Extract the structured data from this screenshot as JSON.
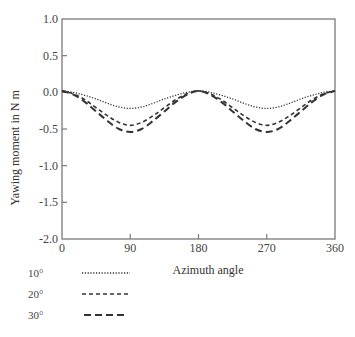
{
  "chart_data": {
    "type": "line",
    "title": "",
    "xlabel": "Azimuth angle",
    "ylabel": "Yawing moment in N m",
    "xlim": [
      0,
      360
    ],
    "ylim": [
      -2.0,
      1.0
    ],
    "xticks": [
      0,
      90,
      180,
      270,
      360
    ],
    "xtick_labels": [
      "0",
      "90",
      "180",
      "270",
      "360"
    ],
    "yticks": [
      1.0,
      0.5,
      0.0,
      -0.5,
      -1.0,
      -1.5,
      -2.0
    ],
    "ytick_labels": [
      "1.0",
      "0.5",
      "0.0",
      "-0.5",
      "-1.0",
      "-1.5",
      "-2.0"
    ],
    "grid": false,
    "legend_position": "below-left",
    "x": [
      0,
      15,
      30,
      45,
      60,
      75,
      90,
      105,
      120,
      135,
      150,
      165,
      180,
      195,
      210,
      225,
      240,
      255,
      270,
      285,
      300,
      315,
      330,
      345,
      360
    ],
    "series": [
      {
        "name": "10°",
        "style": "dotted",
        "values": [
          0.02,
          0.0,
          -0.04,
          -0.09,
          -0.15,
          -0.2,
          -0.22,
          -0.2,
          -0.15,
          -0.09,
          -0.04,
          0.0,
          0.02,
          0.0,
          -0.04,
          -0.09,
          -0.15,
          -0.2,
          -0.22,
          -0.2,
          -0.15,
          -0.09,
          -0.04,
          0.0,
          0.02
        ]
      },
      {
        "name": "20°",
        "style": "dashed",
        "values": [
          0.02,
          -0.02,
          -0.1,
          -0.21,
          -0.32,
          -0.41,
          -0.45,
          -0.41,
          -0.32,
          -0.21,
          -0.1,
          -0.02,
          0.02,
          -0.02,
          -0.1,
          -0.21,
          -0.32,
          -0.41,
          -0.45,
          -0.41,
          -0.32,
          -0.21,
          -0.1,
          -0.02,
          0.02
        ]
      },
      {
        "name": "30°",
        "style": "long-dashed",
        "values": [
          0.02,
          -0.03,
          -0.13,
          -0.26,
          -0.39,
          -0.5,
          -0.54,
          -0.5,
          -0.39,
          -0.26,
          -0.13,
          -0.03,
          0.02,
          -0.03,
          -0.13,
          -0.26,
          -0.39,
          -0.5,
          -0.54,
          -0.5,
          -0.39,
          -0.26,
          -0.13,
          -0.03,
          0.02
        ]
      }
    ]
  },
  "colors": {
    "axis": "#7a7a7a",
    "series": "#333333",
    "text": "#444444"
  }
}
